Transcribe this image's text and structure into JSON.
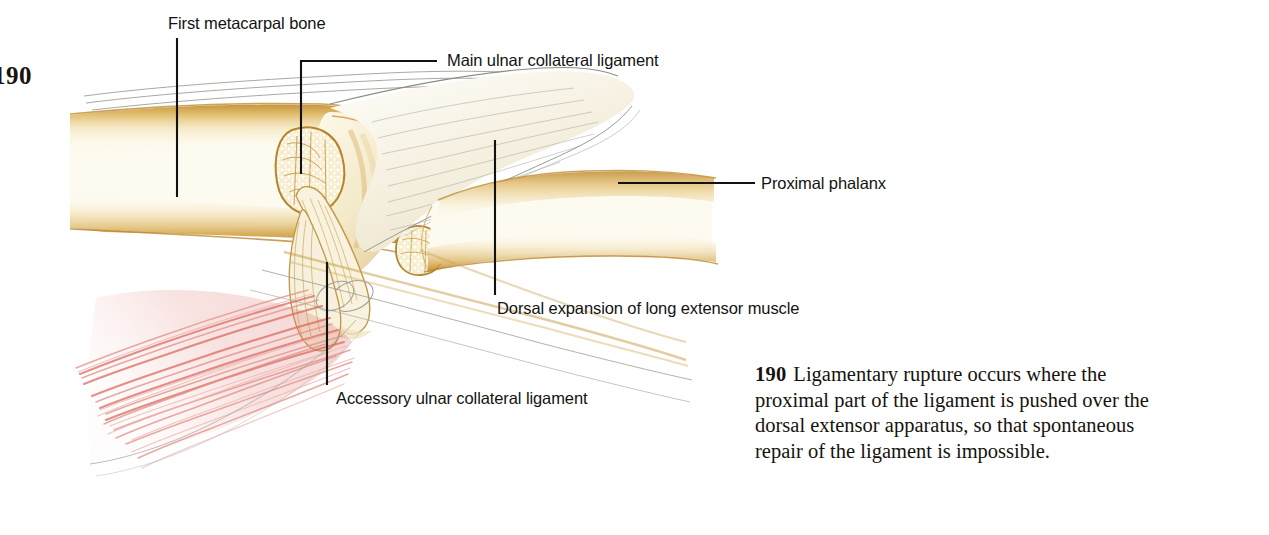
{
  "page": {
    "folio": "190",
    "width": 1269,
    "height": 535,
    "background": "#ffffff"
  },
  "figure": {
    "type": "anatomical-illustration",
    "palette": {
      "bone_outline": "#b98a35",
      "bone_fill_light": "#fdfaf0",
      "bone_fill_mid": "#f0e4c3",
      "bone_shade": "#d9b45f",
      "cortex_tan": "#c9933a",
      "ligament_pale": "#f7f4ea",
      "ligament_line": "#9a9a94",
      "muscle_red": "#e08b84",
      "muscle_red_deep": "#d4645c",
      "leader_line": "#111111",
      "text": "#131313"
    }
  },
  "callouts": [
    {
      "id": "metacarpal",
      "label": "First metacarpal bone",
      "leader": "vertical"
    },
    {
      "id": "main-ucl",
      "label": "Main ulnar collateral ligament",
      "leader": "elbow-left"
    },
    {
      "id": "proximal",
      "label": "Proximal phalanx",
      "leader": "horizontal"
    },
    {
      "id": "dorsal",
      "label": "Dorsal expansion of long extensor muscle",
      "leader": "vertical"
    },
    {
      "id": "accessory",
      "label": "Accessory ulnar collateral ligament",
      "leader": "vertical"
    }
  ],
  "caption": {
    "number": "190",
    "text": "Ligamentary rupture occurs where the proximal part of the ligament is pushed over the dorsal extensor apparatus, so that spontaneous repair of the ligament is impossible."
  }
}
